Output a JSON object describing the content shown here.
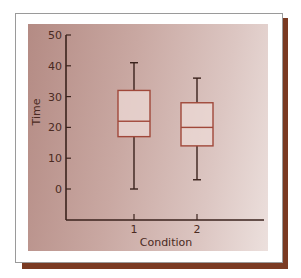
{
  "chart_data": {
    "type": "box",
    "title": "",
    "xlabel": "Condition",
    "ylabel": "Time",
    "categories": [
      "1",
      "2"
    ],
    "ylim": [
      -10,
      50
    ],
    "yticks": [
      0,
      10,
      20,
      30,
      40,
      50
    ],
    "ytick_labels": [
      "0",
      "10",
      "20",
      "30",
      "40",
      "50"
    ],
    "grid": false,
    "legend": null,
    "series": [
      {
        "name": "1",
        "min": 0,
        "q1": 17,
        "median": 22,
        "q3": 32,
        "max": 41
      },
      {
        "name": "2",
        "min": 3,
        "q1": 14,
        "median": 20,
        "q3": 28,
        "max": 36
      }
    ],
    "colors": {
      "box_stroke": "#a0483a",
      "box_fill": "#ecdad6",
      "whisker": "#3a221c",
      "axis": "#3a221c",
      "shadow": "#7a3a22"
    }
  },
  "axes": {
    "x_title": "Condition",
    "y_title": "Time",
    "x_ticks": [
      "1",
      "2"
    ],
    "y_ticks": [
      "0",
      "10",
      "20",
      "30",
      "40",
      "50"
    ]
  }
}
